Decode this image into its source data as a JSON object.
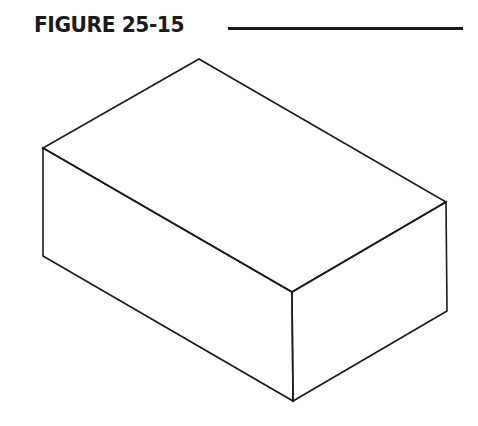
{
  "figure": {
    "label": "FIGURE 25-15"
  },
  "diagram": {
    "stroke_color": "#1a1a1a",
    "vertices": {
      "top_back": [
        199,
        59
      ],
      "left_top": [
        43,
        148
      ],
      "right_top": [
        446,
        202
      ],
      "front_top": [
        292,
        292
      ],
      "left_bottom": [
        43,
        256
      ],
      "right_bottom": [
        447,
        311
      ],
      "front_bottom": [
        293,
        401
      ]
    }
  }
}
